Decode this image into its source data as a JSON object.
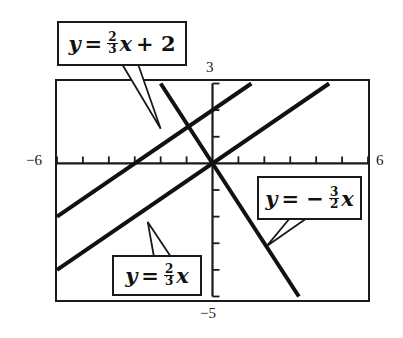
{
  "chart_data": {
    "type": "line",
    "title": "",
    "xlabel": "",
    "ylabel": "",
    "xlim": [
      -6,
      6
    ],
    "ylim": [
      -5,
      3
    ],
    "grid": false,
    "x_ticks": [
      -6,
      -5,
      -4,
      -3,
      -2,
      -1,
      0,
      1,
      2,
      3,
      4,
      5,
      6
    ],
    "y_ticks": [
      -5,
      -4,
      -3,
      -2,
      -1,
      0,
      1,
      2,
      3
    ],
    "tick_labels": {
      "x_min": "−6",
      "x_max": "6",
      "y_max": "3",
      "y_min": "−5"
    },
    "series": [
      {
        "name": "y = 2/3 x + 2",
        "slope": 0.6667,
        "intercept": 2,
        "x": [
          -6,
          1.5
        ],
        "y": [
          -2,
          3
        ]
      },
      {
        "name": "y = 2/3 x",
        "slope": 0.6667,
        "intercept": 0,
        "x": [
          -6,
          4.5
        ],
        "y": [
          -4,
          3
        ]
      },
      {
        "name": "y = -3/2 x",
        "slope": -1.5,
        "intercept": 0,
        "x": [
          -2,
          3.333
        ],
        "y": [
          3,
          -5
        ]
      }
    ],
    "annotations": [
      {
        "text": "y = 2/3 x + 2",
        "pointer_to": [
          -2,
          1.3
        ]
      },
      {
        "text": "y = -3/2 x",
        "pointer_to": [
          2.1,
          -3.1
        ]
      },
      {
        "text": "y = 2/3 x",
        "pointer_to": [
          -2.5,
          -2.2
        ]
      }
    ],
    "legend_position": "callout boxes"
  },
  "labels": {
    "eq1": {
      "y": "y",
      "eq": "=",
      "num": "2",
      "den": "3",
      "x": "x",
      "rest": "+ 2"
    },
    "eq2": {
      "y": "y",
      "eq": "= −",
      "num": "3",
      "den": "2",
      "x": "x"
    },
    "eq3": {
      "y": "y",
      "eq": "=",
      "num": "2",
      "den": "3",
      "x": "x"
    }
  },
  "ticks": {
    "x_min": "−6",
    "x_max": "6",
    "y_max": "3",
    "y_min": "−5"
  },
  "style": {
    "line_color": "#111111",
    "frame_color": "#1a1a1a",
    "background": "#ffffff"
  }
}
